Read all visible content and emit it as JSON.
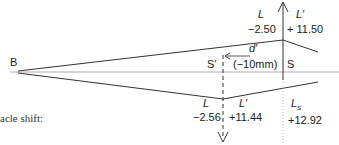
{
  "diagram": {
    "point_label": "B",
    "caption_fragment": "acle shift:",
    "upper_lens": {
      "L_label": "L",
      "L_value": "−2.50",
      "Lprime_label": "L′",
      "Lprime_value": "+ 11.50"
    },
    "displacement": {
      "label": "d′",
      "value": "(−10mm)",
      "S_prime": "S′",
      "S": "S"
    },
    "lower_lens": {
      "L_label": "L",
      "L_value": "−2.56",
      "Lprime_label": "L′",
      "Lprime_value": "+11.44",
      "Ls_label": "L",
      "Ls_subscript": "s",
      "Ls_value": "+12.92"
    }
  }
}
